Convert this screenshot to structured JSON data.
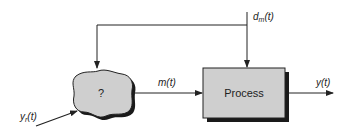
{
  "diagram": {
    "type": "block-diagram",
    "blocks": {
      "controller": {
        "label": "?"
      },
      "process": {
        "label": "Process"
      }
    },
    "signals": {
      "setpoint": {
        "label": "y",
        "subscript": "r",
        "arg": "(t)"
      },
      "manipulated": {
        "label": "m(t)"
      },
      "output": {
        "label": "y(t)"
      },
      "disturbance": {
        "label": "d",
        "subscript": "m",
        "arg": "(t)"
      }
    },
    "colors": {
      "block_fill": "#cfcfcf",
      "shadow": "#1a1a1a",
      "line": "#222222"
    }
  }
}
